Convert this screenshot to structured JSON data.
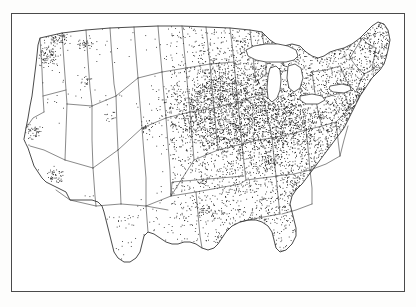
{
  "figure": {
    "kind": "dot-density-map",
    "title": "",
    "caption": "",
    "frame": {
      "stroke": "#4a4a4a",
      "fill": "#ffffff",
      "x": 11,
      "y": 13,
      "width": 394,
      "height": 279
    }
  },
  "map": {
    "region": "Contiguous United States",
    "projection": "conic",
    "boundary_color": "#333333",
    "dot_color": "#141414",
    "background_color": "#ffffff",
    "lakes_drawn": true,
    "state_borders_drawn": true,
    "labels": [],
    "legend": {
      "present": false,
      "entries": []
    }
  },
  "chart_data": {
    "type": "scatter",
    "title": "",
    "subtitle": "",
    "xlabel": "",
    "ylabel": "",
    "grid": false,
    "legend_position": "none",
    "encoding": "one dot per observation (dot-density)",
    "xlim": [
      -125,
      -66
    ],
    "ylim": [
      24,
      50
    ],
    "density_clusters": [
      {
        "name": "Upper Midwest core (Iowa, Illinois, Minnesota, Wisconsin, Missouri)",
        "cx": 232,
        "cy": 108,
        "rx": 46,
        "ry": 34,
        "intensity": 1.0
      },
      {
        "name": "Indiana / Ohio",
        "cx": 278,
        "cy": 122,
        "rx": 26,
        "ry": 20,
        "intensity": 0.72
      },
      {
        "name": "Puget Sound, Washington",
        "cx": 58,
        "cy": 36,
        "rx": 9,
        "ry": 7,
        "intensity": 0.95
      },
      {
        "name": "Portland / Willamette Valley, Oregon",
        "cx": 48,
        "cy": 56,
        "rx": 7,
        "ry": 9,
        "intensity": 0.9
      },
      {
        "name": "Spokane / eastern Washington",
        "cx": 85,
        "cy": 44,
        "rx": 6,
        "ry": 5,
        "intensity": 0.7
      },
      {
        "name": "Boise, Idaho",
        "cx": 86,
        "cy": 81,
        "rx": 4,
        "ry": 4,
        "intensity": 0.65
      },
      {
        "name": "Salt Lake City, Utah",
        "cx": 110,
        "cy": 117,
        "rx": 4,
        "ry": 5,
        "intensity": 0.72
      },
      {
        "name": "Denver / Front Range, Colorado",
        "cx": 146,
        "cy": 128,
        "rx": 5,
        "ry": 6,
        "intensity": 0.68
      },
      {
        "name": "San Francisco Bay Area, California",
        "cx": 33,
        "cy": 131,
        "rx": 6,
        "ry": 6,
        "intensity": 0.88
      },
      {
        "name": "Los Angeles basin, California",
        "cx": 55,
        "cy": 176,
        "rx": 8,
        "ry": 6,
        "intensity": 0.9
      },
      {
        "name": "Phoenix, Arizona",
        "cx": 88,
        "cy": 196,
        "rx": 4,
        "ry": 3,
        "intensity": 0.5
      },
      {
        "name": "Dallas-Fort Worth, Texas",
        "cx": 208,
        "cy": 211,
        "rx": 5,
        "ry": 4,
        "intensity": 0.78
      },
      {
        "name": "Houston, Texas",
        "cx": 218,
        "cy": 236,
        "rx": 4,
        "ry": 4,
        "intensity": 0.6
      },
      {
        "name": "Oklahoma City, Oklahoma",
        "cx": 203,
        "cy": 180,
        "rx": 4,
        "ry": 3,
        "intensity": 0.62
      },
      {
        "name": "Kansas City",
        "cx": 208,
        "cy": 144,
        "rx": 5,
        "ry": 4,
        "intensity": 0.7
      },
      {
        "name": "Chicago, Illinois",
        "cx": 262,
        "cy": 102,
        "rx": 7,
        "ry": 6,
        "intensity": 0.95
      },
      {
        "name": "Detroit / southern Michigan",
        "cx": 285,
        "cy": 95,
        "rx": 7,
        "ry": 6,
        "intensity": 0.8
      },
      {
        "name": "Nashville / Tennessee Valley",
        "cx": 270,
        "cy": 162,
        "rx": 9,
        "ry": 6,
        "intensity": 0.62
      },
      {
        "name": "Atlanta, Georgia",
        "cx": 293,
        "cy": 182,
        "rx": 5,
        "ry": 5,
        "intensity": 0.6
      },
      {
        "name": "New York / New Jersey metro",
        "cx": 360,
        "cy": 94,
        "rx": 7,
        "ry": 6,
        "intensity": 0.9
      },
      {
        "name": "Philadelphia / Baltimore / Washington corridor",
        "cx": 347,
        "cy": 110,
        "rx": 9,
        "ry": 8,
        "intensity": 0.78
      },
      {
        "name": "Boston / southern New England",
        "cx": 378,
        "cy": 78,
        "rx": 6,
        "ry": 5,
        "intensity": 0.8
      },
      {
        "name": "Pittsburgh, Pennsylvania",
        "cx": 318,
        "cy": 113,
        "rx": 5,
        "ry": 4,
        "intensity": 0.66
      },
      {
        "name": "Sparse desert Southwest (Nevada, Utah, Arizona, New Mexico)",
        "cx": 105,
        "cy": 160,
        "rx": 42,
        "ry": 32,
        "intensity": 0.06
      },
      {
        "name": "Sparse High Plains (Montana, Wyoming, Dakotas)",
        "cx": 150,
        "cy": 70,
        "rx": 55,
        "ry": 35,
        "intensity": 0.16
      }
    ]
  }
}
